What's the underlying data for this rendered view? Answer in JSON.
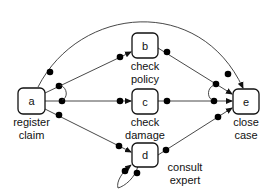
{
  "diagram": {
    "colors": {
      "stroke": "#111111",
      "edge": "#333333",
      "dot": "#000000",
      "background": "#ffffff"
    },
    "nodes": [
      {
        "id": "a",
        "letter": "a",
        "label_line1": "register",
        "label_line2": "claim"
      },
      {
        "id": "b",
        "letter": "b",
        "label_line1": "check",
        "label_line2": "policy"
      },
      {
        "id": "c",
        "letter": "c",
        "label_line1": "check",
        "label_line2": "damage"
      },
      {
        "id": "d",
        "letter": "d",
        "label_line1": "consult",
        "label_line2": "expert"
      },
      {
        "id": "e",
        "letter": "e",
        "label_line1": "close",
        "label_line2": "case"
      }
    ],
    "edges": [
      {
        "from": "a",
        "to": "b"
      },
      {
        "from": "a",
        "to": "c"
      },
      {
        "from": "a",
        "to": "d"
      },
      {
        "from": "a",
        "to": "e"
      },
      {
        "from": "b",
        "to": "e"
      },
      {
        "from": "c",
        "to": "e"
      },
      {
        "from": "d",
        "to": "e"
      },
      {
        "from": "d",
        "to": "d"
      }
    ]
  }
}
